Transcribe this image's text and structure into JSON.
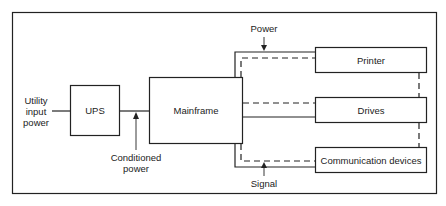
{
  "diagram": {
    "nodes": {
      "utility_input": "Utility input power",
      "utility_lines": [
        "Utility",
        "input",
        "power"
      ],
      "ups": "UPS",
      "mainframe": "Mainframe",
      "printer": "Printer",
      "drives": "Drives",
      "communication": "Communication devices"
    },
    "annotations": {
      "power": "Power",
      "signal": "Signal",
      "conditioned_lines": [
        "Conditioned",
        "power"
      ]
    },
    "legend": {
      "solid_line": "Power",
      "dashed_line": "Signal"
    },
    "edges": [
      {
        "from": "Utility input power",
        "to": "UPS",
        "style": "solid"
      },
      {
        "from": "UPS",
        "to": "Mainframe",
        "style": "solid",
        "label": "Conditioned power"
      },
      {
        "from": "Mainframe",
        "to": "Printer",
        "style": "solid",
        "label": "Power"
      },
      {
        "from": "Mainframe",
        "to": "Printer",
        "style": "dashed"
      },
      {
        "from": "Mainframe",
        "to": "Drives",
        "style": "solid"
      },
      {
        "from": "Mainframe",
        "to": "Drives",
        "style": "dashed"
      },
      {
        "from": "Mainframe",
        "to": "Communication devices",
        "style": "solid"
      },
      {
        "from": "Mainframe",
        "to": "Communication devices",
        "style": "dashed",
        "label": "Signal"
      },
      {
        "from": "Printer",
        "to": "Drives",
        "style": "dashed"
      },
      {
        "from": "Drives",
        "to": "Communication devices",
        "style": "dashed"
      }
    ],
    "colors": {
      "stroke": "#222222",
      "background": "#ffffff"
    }
  }
}
